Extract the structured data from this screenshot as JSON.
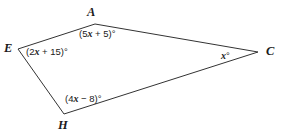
{
  "figure": {
    "type": "quadrilateral-angle-diagram",
    "background_color": "#ffffff",
    "stroke_color": "#333333",
    "stroke_width": 1,
    "vertices": [
      {
        "name": "A",
        "label": "A",
        "x": 95,
        "y": 24
      },
      {
        "name": "C",
        "label": "C",
        "x": 258,
        "y": 52
      },
      {
        "name": "H",
        "label": "H",
        "x": 64,
        "y": 114
      },
      {
        "name": "E",
        "label": "E",
        "x": 18,
        "y": 49
      }
    ],
    "edges": [
      {
        "from": "E",
        "to": "A"
      },
      {
        "from": "A",
        "to": "C"
      },
      {
        "from": "C",
        "to": "H"
      },
      {
        "from": "H",
        "to": "E"
      }
    ],
    "angles": [
      {
        "at": "A",
        "expression": "(5x + 5)°",
        "prefix": "(5",
        "var": "x",
        "suffix": " + 5)°"
      },
      {
        "at": "E",
        "expression": "(2x + 15)°",
        "prefix": "(2",
        "var": "x",
        "suffix": " + 15)°"
      },
      {
        "at": "H",
        "expression": "(4x − 8)°",
        "prefix": "(4",
        "var": "x",
        "suffix": " − 8)°"
      },
      {
        "at": "C",
        "expression": "x°",
        "prefix": "",
        "var": "x",
        "suffix": "°"
      }
    ]
  }
}
